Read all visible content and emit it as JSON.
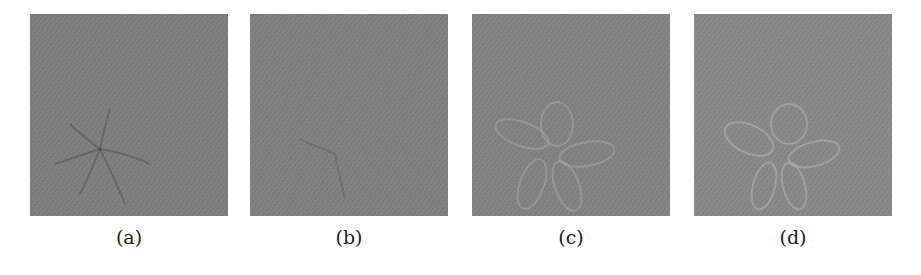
{
  "figure": {
    "panels": [
      {
        "id": "a",
        "label": "(a)",
        "description": "noisy grayscale reconstruction, faint radial flower pattern lower-left",
        "base_color": "#7b7b7b"
      },
      {
        "id": "b",
        "label": "(b)",
        "description": "noisy grayscale reconstruction, pattern barely visible",
        "base_color": "#7d7d7d"
      },
      {
        "id": "c",
        "label": "(c)",
        "description": "noisy grayscale reconstruction, clearer petal pattern lower-left",
        "base_color": "#7f7f7f"
      },
      {
        "id": "d",
        "label": "(d)",
        "description": "noisy grayscale reconstruction, clear petal pattern center-left",
        "base_color": "#868686"
      }
    ]
  }
}
